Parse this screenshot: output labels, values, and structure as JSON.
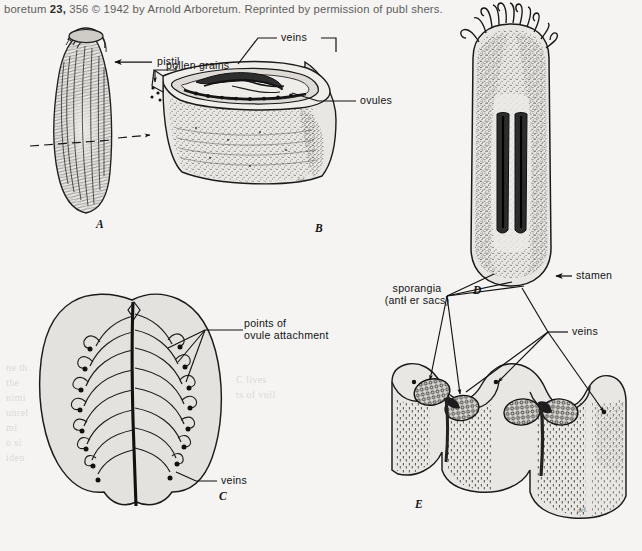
{
  "page": {
    "background_color": "#f5f4f2",
    "ink_color": "#1a1a1a",
    "width": 642,
    "height": 551
  },
  "credit": {
    "prefix": "boretum ",
    "volume": "23,",
    "rest": " 356 © 1942 by Arnold Arboretum. Reprinted by permission of publ shers."
  },
  "figure": {
    "caption_letters": [
      "A",
      "B",
      "C",
      "D",
      "E"
    ],
    "artist_signature": "del.",
    "labels": {
      "pistil": "pistil",
      "pollen_grains": "pollen grains",
      "veins_b": "veins",
      "ovules": "ovules",
      "points_of_ovule_attachment_l1": "points of",
      "points_of_ovule_attachment_l2": "ovule attachment",
      "veins_c": "veins",
      "sporangia_l1": "sporangia",
      "sporangia_l2": "(antł er sacs)",
      "stamen": "stamen",
      "veins_e": "veins"
    },
    "panels": {
      "a": "A",
      "b": "B",
      "c": "C",
      "d": "D",
      "e": "E"
    }
  },
  "show_through": {
    "lines": [
      "ne th",
      "the",
      "nimi",
      "unrel",
      "mi",
      "o si",
      "iden",
      "C  lives",
      "ts of  vuil"
    ]
  }
}
